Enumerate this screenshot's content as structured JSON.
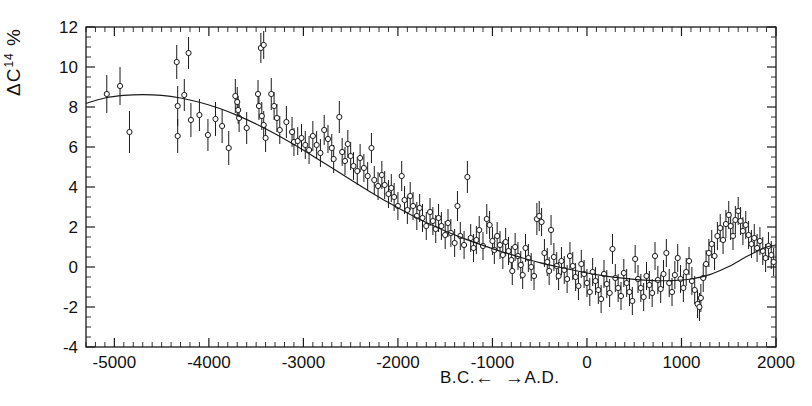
{
  "figure": {
    "background_color": "#ffffff",
    "ink_color": "#1a1a1a",
    "y_axis_label_main": "ΔC",
    "y_axis_label_sup": "14",
    "y_axis_label_unit": "%",
    "x_axis_label_bc": "B.C.",
    "x_axis_label_ad": "A.D.",
    "arrow_left": "←",
    "arrow_right": "→"
  },
  "chart_data": {
    "type": "scatter",
    "title": "",
    "subtitle": "",
    "xlabel": "B.C. ←   → A.D.",
    "ylabel": "ΔC14 %",
    "xlim": [
      -5300,
      2000
    ],
    "ylim": [
      -4,
      12
    ],
    "grid": false,
    "legend": null,
    "x_ticks_major": [
      -5000,
      -4000,
      -3000,
      -2000,
      -1000,
      0,
      1000,
      2000
    ],
    "x_tick_labels": [
      "-5000",
      "-4000",
      "-3000",
      "-2000",
      "-1000",
      "0",
      "1000",
      "2000"
    ],
    "x_minor_step": 100,
    "y_ticks_major": [
      -4,
      -2,
      0,
      2,
      4,
      6,
      8,
      10,
      12
    ],
    "y_tick_labels": [
      "-4",
      "-2",
      "0",
      "2",
      "4",
      "6",
      "8",
      "10",
      "12"
    ],
    "y_minor_step": 0.5,
    "marker_style": "open-circle",
    "error_bar_style": "vertical",
    "fit_curve_name": "smooth sinusoidal fit",
    "fit_curve": {
      "x": [
        -5300,
        -5100,
        -4900,
        -4700,
        -4500,
        -4300,
        -4100,
        -3900,
        -3700,
        -3500,
        -3300,
        -3100,
        -2900,
        -2700,
        -2500,
        -2300,
        -2100,
        -1900,
        -1700,
        -1500,
        -1300,
        -1100,
        -900,
        -700,
        -500,
        -300,
        -100,
        100,
        300,
        500,
        700,
        900,
        1100,
        1300,
        1500,
        1700,
        1900,
        2000
      ],
      "y": [
        8.18,
        8.45,
        8.58,
        8.62,
        8.58,
        8.45,
        8.24,
        7.95,
        7.58,
        7.15,
        6.66,
        6.12,
        5.55,
        4.96,
        4.36,
        3.78,
        3.22,
        2.7,
        2.22,
        1.8,
        1.42,
        1.08,
        0.76,
        0.48,
        0.22,
        0.0,
        -0.2,
        -0.38,
        -0.52,
        -0.62,
        -0.68,
        -0.68,
        -0.6,
        -0.38,
        0.02,
        0.55,
        1.0,
        1.1
      ]
    },
    "points": [
      {
        "x": -5080,
        "y": 8.65,
        "err": 0.95
      },
      {
        "x": -4940,
        "y": 9.05,
        "err": 0.95
      },
      {
        "x": -4840,
        "y": 6.75,
        "err": 1.05
      },
      {
        "x": -4340,
        "y": 10.25,
        "err": 0.85
      },
      {
        "x": -4215,
        "y": 10.7,
        "err": 0.8
      },
      {
        "x": -4330,
        "y": 8.05,
        "err": 1.0
      },
      {
        "x": -4330,
        "y": 6.55,
        "err": 0.85
      },
      {
        "x": -4260,
        "y": 8.6,
        "err": 0.8
      },
      {
        "x": -4190,
        "y": 7.35,
        "err": 0.85
      },
      {
        "x": -4100,
        "y": 7.6,
        "err": 0.8
      },
      {
        "x": -4010,
        "y": 6.6,
        "err": 0.8
      },
      {
        "x": -3930,
        "y": 7.4,
        "err": 0.85
      },
      {
        "x": -3860,
        "y": 7.05,
        "err": 0.85
      },
      {
        "x": -3790,
        "y": 5.95,
        "err": 0.85
      },
      {
        "x": -3720,
        "y": 8.55,
        "err": 0.85
      },
      {
        "x": -3700,
        "y": 8.25,
        "err": 0.75
      },
      {
        "x": -3690,
        "y": 7.85,
        "err": 0.7
      },
      {
        "x": -3680,
        "y": 7.45,
        "err": 0.7
      },
      {
        "x": -3600,
        "y": 6.95,
        "err": 0.8
      },
      {
        "x": -3450,
        "y": 10.95,
        "err": 0.75
      },
      {
        "x": -3420,
        "y": 11.1,
        "err": 0.7
      },
      {
        "x": -3480,
        "y": 8.65,
        "err": 0.7
      },
      {
        "x": -3470,
        "y": 8.05,
        "err": 0.7
      },
      {
        "x": -3440,
        "y": 7.55,
        "err": 0.7
      },
      {
        "x": -3420,
        "y": 7.1,
        "err": 0.7
      },
      {
        "x": -3400,
        "y": 6.45,
        "err": 0.7
      },
      {
        "x": -3340,
        "y": 8.65,
        "err": 0.8
      },
      {
        "x": -3310,
        "y": 8.05,
        "err": 0.7
      },
      {
        "x": -3280,
        "y": 7.45,
        "err": 0.7
      },
      {
        "x": -3250,
        "y": 6.85,
        "err": 0.7
      },
      {
        "x": -3180,
        "y": 7.25,
        "err": 0.8
      },
      {
        "x": -3120,
        "y": 6.75,
        "err": 0.75
      },
      {
        "x": -3100,
        "y": 6.25,
        "err": 0.7
      },
      {
        "x": -3060,
        "y": 6.3,
        "err": 0.7
      },
      {
        "x": -3020,
        "y": 6.45,
        "err": 0.7
      },
      {
        "x": -2980,
        "y": 6.1,
        "err": 0.7
      },
      {
        "x": -2940,
        "y": 5.85,
        "err": 0.7
      },
      {
        "x": -2900,
        "y": 6.55,
        "err": 0.75
      },
      {
        "x": -2860,
        "y": 6.1,
        "err": 0.7
      },
      {
        "x": -2820,
        "y": 5.7,
        "err": 0.7
      },
      {
        "x": -2780,
        "y": 6.85,
        "err": 0.75
      },
      {
        "x": -2740,
        "y": 6.4,
        "err": 0.7
      },
      {
        "x": -2700,
        "y": 5.95,
        "err": 0.7
      },
      {
        "x": -2680,
        "y": 5.4,
        "err": 0.7
      },
      {
        "x": -2620,
        "y": 7.5,
        "err": 0.8
      },
      {
        "x": -2590,
        "y": 5.75,
        "err": 0.7
      },
      {
        "x": -2560,
        "y": 5.3,
        "err": 0.7
      },
      {
        "x": -2530,
        "y": 6.15,
        "err": 0.7
      },
      {
        "x": -2500,
        "y": 5.55,
        "err": 0.7
      },
      {
        "x": -2470,
        "y": 5.05,
        "err": 0.7
      },
      {
        "x": -2430,
        "y": 4.8,
        "err": 0.7
      },
      {
        "x": -2400,
        "y": 5.45,
        "err": 0.7
      },
      {
        "x": -2360,
        "y": 4.95,
        "err": 0.7
      },
      {
        "x": -2320,
        "y": 4.55,
        "err": 0.7
      },
      {
        "x": -2280,
        "y": 5.95,
        "err": 0.75
      },
      {
        "x": -2250,
        "y": 4.35,
        "err": 0.7
      },
      {
        "x": -2210,
        "y": 4.05,
        "err": 0.7
      },
      {
        "x": -2170,
        "y": 4.6,
        "err": 0.7
      },
      {
        "x": -2140,
        "y": 4.1,
        "err": 0.7
      },
      {
        "x": -2100,
        "y": 3.65,
        "err": 0.7
      },
      {
        "x": -2070,
        "y": 3.95,
        "err": 0.7
      },
      {
        "x": -2040,
        "y": 3.5,
        "err": 0.7
      },
      {
        "x": -2000,
        "y": 3.05,
        "err": 0.7
      },
      {
        "x": -1960,
        "y": 4.55,
        "err": 0.75
      },
      {
        "x": -1930,
        "y": 3.35,
        "err": 0.7
      },
      {
        "x": -1900,
        "y": 2.85,
        "err": 0.7
      },
      {
        "x": -1870,
        "y": 3.55,
        "err": 0.7
      },
      {
        "x": -1840,
        "y": 3.05,
        "err": 0.7
      },
      {
        "x": -1800,
        "y": 2.55,
        "err": 0.7
      },
      {
        "x": -1770,
        "y": 2.95,
        "err": 0.7
      },
      {
        "x": -1740,
        "y": 2.45,
        "err": 0.7
      },
      {
        "x": -1700,
        "y": 2.05,
        "err": 0.7
      },
      {
        "x": -1660,
        "y": 2.75,
        "err": 0.7
      },
      {
        "x": -1630,
        "y": 2.3,
        "err": 0.7
      },
      {
        "x": -1600,
        "y": 1.9,
        "err": 0.7
      },
      {
        "x": -1570,
        "y": 2.45,
        "err": 0.7
      },
      {
        "x": -1540,
        "y": 2.05,
        "err": 0.7
      },
      {
        "x": -1500,
        "y": 1.6,
        "err": 0.7
      },
      {
        "x": -1470,
        "y": 2.2,
        "err": 0.7
      },
      {
        "x": -1440,
        "y": 1.7,
        "err": 0.7
      },
      {
        "x": -1400,
        "y": 1.2,
        "err": 0.7
      },
      {
        "x": -1370,
        "y": 3.05,
        "err": 0.75
      },
      {
        "x": -1340,
        "y": 1.55,
        "err": 0.7
      },
      {
        "x": -1300,
        "y": 1.1,
        "err": 0.7
      },
      {
        "x": -1265,
        "y": 4.5,
        "err": 0.8
      },
      {
        "x": -1230,
        "y": 1.45,
        "err": 0.7
      },
      {
        "x": -1200,
        "y": 0.95,
        "err": 0.7
      },
      {
        "x": -1170,
        "y": 1.35,
        "err": 0.7
      },
      {
        "x": -1140,
        "y": 1.85,
        "err": 0.7
      },
      {
        "x": -1100,
        "y": 1.05,
        "err": 0.7
      },
      {
        "x": -1060,
        "y": 2.4,
        "err": 0.75
      },
      {
        "x": -1030,
        "y": 2.1,
        "err": 0.7
      },
      {
        "x": -1000,
        "y": 1.3,
        "err": 0.7
      },
      {
        "x": -980,
        "y": 0.85,
        "err": 0.7
      },
      {
        "x": -950,
        "y": 1.55,
        "err": 0.7
      },
      {
        "x": -920,
        "y": 1.1,
        "err": 0.7
      },
      {
        "x": -890,
        "y": 0.6,
        "err": 0.7
      },
      {
        "x": -860,
        "y": 1.25,
        "err": 0.7
      },
      {
        "x": -830,
        "y": 0.8,
        "err": 0.7
      },
      {
        "x": -800,
        "y": 0.35,
        "err": 0.7
      },
      {
        "x": -790,
        "y": -0.2,
        "err": 0.7
      },
      {
        "x": -760,
        "y": 1.0,
        "err": 0.7
      },
      {
        "x": -730,
        "y": 0.55,
        "err": 0.7
      },
      {
        "x": -700,
        "y": 0.1,
        "err": 0.7
      },
      {
        "x": -680,
        "y": -0.4,
        "err": 0.7
      },
      {
        "x": -650,
        "y": 0.95,
        "err": 0.7
      },
      {
        "x": -620,
        "y": 0.45,
        "err": 0.7
      },
      {
        "x": -590,
        "y": 0.0,
        "err": 0.7
      },
      {
        "x": -560,
        "y": -0.45,
        "err": 0.7
      },
      {
        "x": -530,
        "y": 2.4,
        "err": 0.8
      },
      {
        "x": -505,
        "y": 2.55,
        "err": 0.75
      },
      {
        "x": -480,
        "y": 2.25,
        "err": 0.7
      },
      {
        "x": -450,
        "y": 0.7,
        "err": 0.7
      },
      {
        "x": -420,
        "y": 0.25,
        "err": 0.7
      },
      {
        "x": -400,
        "y": -0.2,
        "err": 0.7
      },
      {
        "x": -380,
        "y": 1.85,
        "err": 0.75
      },
      {
        "x": -350,
        "y": 0.5,
        "err": 0.7
      },
      {
        "x": -320,
        "y": 0.05,
        "err": 0.7
      },
      {
        "x": -300,
        "y": -0.45,
        "err": 0.7
      },
      {
        "x": -270,
        "y": 0.3,
        "err": 0.7
      },
      {
        "x": -240,
        "y": -0.15,
        "err": 0.7
      },
      {
        "x": -210,
        "y": -0.6,
        "err": 0.7
      },
      {
        "x": -180,
        "y": 0.55,
        "err": 0.7
      },
      {
        "x": -150,
        "y": 0.05,
        "err": 0.7
      },
      {
        "x": -120,
        "y": -0.5,
        "err": 0.7
      },
      {
        "x": -90,
        "y": -0.95,
        "err": 0.7
      },
      {
        "x": -60,
        "y": 0.15,
        "err": 0.7
      },
      {
        "x": -30,
        "y": -0.35,
        "err": 0.7
      },
      {
        "x": 0,
        "y": -0.8,
        "err": 0.7
      },
      {
        "x": 30,
        "y": -1.25,
        "err": 0.7
      },
      {
        "x": 60,
        "y": -0.25,
        "err": 0.7
      },
      {
        "x": 90,
        "y": -0.7,
        "err": 0.7
      },
      {
        "x": 120,
        "y": -1.15,
        "err": 0.7
      },
      {
        "x": 150,
        "y": -1.6,
        "err": 0.7
      },
      {
        "x": 180,
        "y": -0.35,
        "err": 0.7
      },
      {
        "x": 210,
        "y": -0.85,
        "err": 0.7
      },
      {
        "x": 240,
        "y": -1.3,
        "err": 0.7
      },
      {
        "x": 270,
        "y": 0.9,
        "err": 0.75
      },
      {
        "x": 300,
        "y": -0.55,
        "err": 0.7
      },
      {
        "x": 330,
        "y": -1.05,
        "err": 0.7
      },
      {
        "x": 360,
        "y": -1.45,
        "err": 0.7
      },
      {
        "x": 390,
        "y": -0.3,
        "err": 0.7
      },
      {
        "x": 420,
        "y": -0.8,
        "err": 0.7
      },
      {
        "x": 450,
        "y": -1.25,
        "err": 0.7
      },
      {
        "x": 480,
        "y": -1.7,
        "err": 0.7
      },
      {
        "x": 510,
        "y": 0.4,
        "err": 0.7
      },
      {
        "x": 540,
        "y": -0.6,
        "err": 0.7
      },
      {
        "x": 570,
        "y": -1.05,
        "err": 0.7
      },
      {
        "x": 600,
        "y": -1.5,
        "err": 0.7
      },
      {
        "x": 630,
        "y": -0.45,
        "err": 0.7
      },
      {
        "x": 660,
        "y": -0.9,
        "err": 0.7
      },
      {
        "x": 690,
        "y": -1.3,
        "err": 0.7
      },
      {
        "x": 720,
        "y": 0.55,
        "err": 0.7
      },
      {
        "x": 750,
        "y": -0.65,
        "err": 0.7
      },
      {
        "x": 780,
        "y": -1.1,
        "err": 0.7
      },
      {
        "x": 810,
        "y": -0.35,
        "err": 0.7
      },
      {
        "x": 840,
        "y": 0.7,
        "err": 0.7
      },
      {
        "x": 870,
        "y": -0.8,
        "err": 0.7
      },
      {
        "x": 900,
        "y": -1.25,
        "err": 0.7
      },
      {
        "x": 930,
        "y": -0.4,
        "err": 0.7
      },
      {
        "x": 960,
        "y": 0.45,
        "err": 0.7
      },
      {
        "x": 990,
        "y": -0.6,
        "err": 0.7
      },
      {
        "x": 1020,
        "y": -1.05,
        "err": 0.7
      },
      {
        "x": 1050,
        "y": -0.25,
        "err": 0.7
      },
      {
        "x": 1080,
        "y": 0.3,
        "err": 0.7
      },
      {
        "x": 1110,
        "y": -0.7,
        "err": 0.7
      },
      {
        "x": 1140,
        "y": -1.15,
        "err": 0.7
      },
      {
        "x": 1170,
        "y": -1.85,
        "err": 0.7
      },
      {
        "x": 1190,
        "y": -2.0,
        "err": 0.7
      },
      {
        "x": 1205,
        "y": -1.55,
        "err": 0.7
      },
      {
        "x": 1230,
        "y": -0.55,
        "err": 0.7
      },
      {
        "x": 1260,
        "y": 0.15,
        "err": 0.7
      },
      {
        "x": 1290,
        "y": 0.7,
        "err": 0.7
      },
      {
        "x": 1320,
        "y": 1.15,
        "err": 0.7
      },
      {
        "x": 1350,
        "y": 0.55,
        "err": 0.7
      },
      {
        "x": 1380,
        "y": 1.55,
        "err": 0.7
      },
      {
        "x": 1410,
        "y": 1.95,
        "err": 0.7
      },
      {
        "x": 1440,
        "y": 1.35,
        "err": 0.7
      },
      {
        "x": 1470,
        "y": 2.15,
        "err": 0.7
      },
      {
        "x": 1500,
        "y": 2.6,
        "err": 0.7
      },
      {
        "x": 1520,
        "y": 2.05,
        "err": 0.7
      },
      {
        "x": 1545,
        "y": 1.55,
        "err": 0.7
      },
      {
        "x": 1570,
        "y": 2.35,
        "err": 0.7
      },
      {
        "x": 1600,
        "y": 2.8,
        "err": 0.7
      },
      {
        "x": 1625,
        "y": 2.3,
        "err": 0.7
      },
      {
        "x": 1650,
        "y": 1.8,
        "err": 0.7
      },
      {
        "x": 1680,
        "y": 2.1,
        "err": 0.7
      },
      {
        "x": 1710,
        "y": 1.6,
        "err": 0.7
      },
      {
        "x": 1740,
        "y": 1.15,
        "err": 0.7
      },
      {
        "x": 1770,
        "y": 1.45,
        "err": 0.7
      },
      {
        "x": 1800,
        "y": 0.95,
        "err": 0.7
      },
      {
        "x": 1830,
        "y": 1.3,
        "err": 0.7
      },
      {
        "x": 1860,
        "y": 0.8,
        "err": 0.7
      },
      {
        "x": 1890,
        "y": 0.45,
        "err": 0.7
      },
      {
        "x": 1920,
        "y": 1.05,
        "err": 0.7
      },
      {
        "x": 1950,
        "y": 0.6,
        "err": 0.7
      },
      {
        "x": 1975,
        "y": 0.25,
        "err": 0.7
      }
    ]
  }
}
